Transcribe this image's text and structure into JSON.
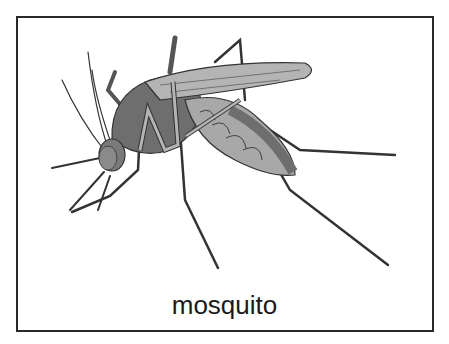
{
  "card": {
    "caption": "mosquito",
    "subject_icon": "mosquito-illustration"
  },
  "colors": {
    "border": "#2a2a2a",
    "body_dark": "#6e6e6e",
    "body_light": "#a8a8a8",
    "outline": "#333333",
    "background": "#ffffff"
  }
}
